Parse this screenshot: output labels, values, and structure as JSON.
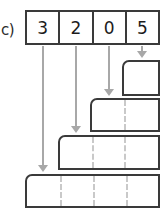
{
  "figure": {
    "part_label": "c)",
    "type": "place-value-bar-model",
    "colors": {
      "stroke": "#3a3a3a",
      "digit_text": "#1c1c1c",
      "arrow": "#a8a8a8",
      "dashed_divider": "#c9c9c9",
      "background": "#ffffff"
    }
  },
  "digit_table": {
    "name": "digit-row",
    "cells": [
      {
        "value": "3"
      },
      {
        "value": "2"
      },
      {
        "value": "0"
      },
      {
        "value": "5"
      }
    ]
  },
  "bars": [
    {
      "name": "bar-ones",
      "digit": "5",
      "left": 122,
      "top": 60,
      "width": 38,
      "height": 36,
      "dashes": []
    },
    {
      "name": "bar-tens",
      "digit": "0",
      "left": 90,
      "top": 98,
      "width": 70,
      "height": 34,
      "dashes": [
        32
      ]
    },
    {
      "name": "bar-hundreds",
      "digit": "2",
      "left": 58,
      "top": 135,
      "width": 102,
      "height": 35,
      "dashes": [
        32,
        64
      ]
    },
    {
      "name": "bar-thousands",
      "digit": "3",
      "left": 25,
      "top": 174,
      "width": 135,
      "height": 34,
      "dashes": [
        33,
        66,
        99
      ]
    }
  ],
  "arrows": [
    {
      "name": "arrow-to-bar-thousands",
      "from_digit": "3",
      "left": 38,
      "top": 46,
      "length": 126
    },
    {
      "name": "arrow-to-bar-hundreds",
      "from_digit": "2",
      "left": 71,
      "top": 46,
      "length": 87
    },
    {
      "name": "arrow-to-bar-tens",
      "from_digit": "0",
      "left": 104,
      "top": 46,
      "length": 50
    },
    {
      "name": "arrow-to-bar-ones",
      "from_digit": "5",
      "left": 137,
      "top": 46,
      "length": 12
    }
  ]
}
